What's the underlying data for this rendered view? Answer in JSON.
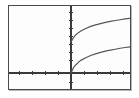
{
  "figure": {
    "name": "graphing-calculator-plot",
    "frame_color": "#4a4a4a",
    "background_color": "#fdfdfd",
    "axis_color": "#3a3a3a",
    "curve_color": "#555555"
  },
  "chart_data": {
    "type": "line",
    "title": "",
    "subtitle": "",
    "xlabel": "",
    "ylabel": "",
    "legend": [],
    "legend_position": "none",
    "grid": false,
    "axes": {
      "x_axis_visible": true,
      "y_axis_visible": true,
      "x_axis_pixel_y": 67,
      "y_axis_pixel_x": 62,
      "xlim": [
        -6,
        6
      ],
      "ylim": [
        -1.2,
        4.2
      ],
      "x_tick_count": 10,
      "y_tick_count": 9,
      "x_tick_labels": [],
      "y_tick_labels": [],
      "tick_spacing_px": 6.5
    },
    "x": [
      0,
      0.25,
      0.5,
      0.75,
      1,
      1.5,
      2,
      2.5,
      3,
      3.5,
      4,
      4.5,
      5,
      5.5,
      6
    ],
    "series": [
      {
        "name": "upper-curve",
        "description": "increasing concave-down curve with positive y-intercept",
        "domain": [
          0,
          6
        ],
        "y_intercept": 1.95,
        "values": [
          1.95,
          2.22,
          2.4,
          2.53,
          2.63,
          2.79,
          2.92,
          3.02,
          3.1,
          3.17,
          3.24,
          3.29,
          3.34,
          3.39,
          3.43
        ]
      },
      {
        "name": "lower-curve",
        "description": "increasing concave-down curve through the origin",
        "domain": [
          0,
          6
        ],
        "y_intercept": 0,
        "values": [
          0,
          0.33,
          0.52,
          0.67,
          0.79,
          0.96,
          1.1,
          1.2,
          1.29,
          1.37,
          1.43,
          1.49,
          1.55,
          1.6,
          1.64
        ]
      }
    ],
    "annotations": []
  }
}
